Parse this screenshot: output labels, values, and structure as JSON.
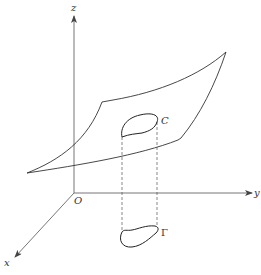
{
  "diagram": {
    "type": "3d-surface-projection",
    "axes": {
      "origin_label": "O",
      "x_label": "x",
      "y_label": "y",
      "z_label": "z"
    },
    "curves": {
      "space_curve_label": "C",
      "projected_curve_label": "Γ"
    },
    "colors": {
      "line": "#333333",
      "axis": "#666666",
      "background": "#ffffff"
    }
  }
}
